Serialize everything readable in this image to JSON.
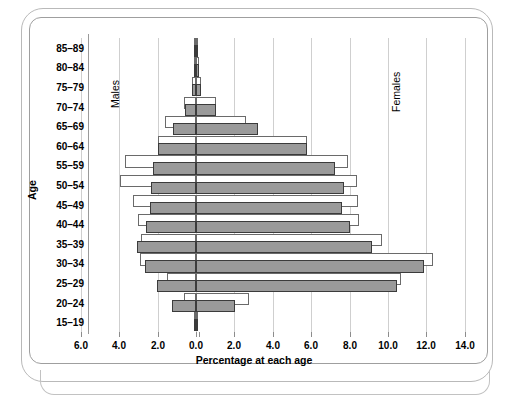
{
  "chart_data": {
    "type": "bar",
    "subtype": "population-pyramid",
    "title": "",
    "xlabel": "Percentage at each age",
    "ylabel": "Age",
    "categories": [
      "15–19",
      "20–24",
      "25–29",
      "30–34",
      "35–39",
      "40–44",
      "45–49",
      "50–54",
      "55–59",
      "60–64",
      "65–69",
      "70–74",
      "75–79",
      "80–84",
      "85–89"
    ],
    "xtick_labels_left": [
      "6.0",
      "4.0",
      "2.0"
    ],
    "xtick_labels_center": "0.0",
    "xtick_labels_right": [
      "2.0",
      "4.0",
      "6.0",
      "8.0",
      "10.0",
      "12.0",
      "14.0"
    ],
    "xtick_values": [
      -6.0,
      -4.0,
      -2.0,
      0.0,
      2.0,
      4.0,
      6.0,
      8.0,
      10.0,
      12.0,
      14.0
    ],
    "xlim": [
      -6.8,
      15.2
    ],
    "grid": true,
    "legend_position": "inside-plot",
    "side_labels": {
      "left": "Males",
      "right": "Females"
    },
    "colors": {
      "front_bar_fill": "#9a9a9a",
      "front_bar_stroke": "#3b3b3b",
      "back_bar_fill": "#ffffff",
      "back_bar_stroke": "#6a6a6a",
      "gridline": "#cfcfcf",
      "text": "#000000"
    },
    "series": [
      {
        "name": "Males (front, grey)",
        "side": "left",
        "values": [
          0.05,
          1.25,
          2.05,
          2.65,
          3.05,
          2.6,
          2.4,
          2.35,
          2.25,
          2.0,
          1.2,
          0.55,
          0.2,
          0.12,
          0.05
        ]
      },
      {
        "name": "Males (back, outline)",
        "side": "left",
        "values": [
          0.05,
          0.6,
          1.5,
          2.9,
          2.85,
          3.0,
          3.3,
          3.95,
          3.7,
          2.0,
          1.6,
          0.6,
          0.2,
          0.12,
          0.05
        ]
      },
      {
        "name": "Females (front, grey)",
        "side": "right",
        "values": [
          0.1,
          2.05,
          10.45,
          11.85,
          9.15,
          8.0,
          7.6,
          7.7,
          7.25,
          5.8,
          3.25,
          1.05,
          0.25,
          0.15,
          0.08
        ]
      },
      {
        "name": "Females (back, outline)",
        "side": "right",
        "values": [
          0.1,
          2.75,
          10.7,
          12.35,
          9.7,
          8.5,
          8.45,
          8.4,
          7.9,
          5.8,
          2.6,
          1.05,
          0.25,
          0.15,
          0.08
        ]
      }
    ]
  },
  "layout": {
    "zero_x_px": 196,
    "px_per_unit": 19.2,
    "plot_top_px": 38,
    "plot_bottom_px": 332,
    "row_height_px": 19.6
  }
}
